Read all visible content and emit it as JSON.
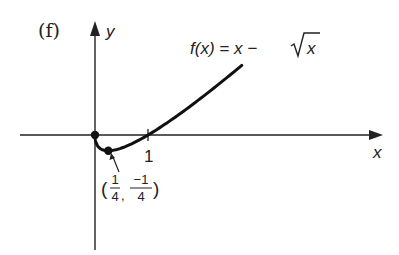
{
  "figure": {
    "panel_label": "(f)",
    "function_label": "f(x) = x − √x",
    "function_label_parts": {
      "lhs": "f(x) = x − ",
      "radicand": "x"
    }
  },
  "axes": {
    "x_label": "x",
    "y_label": "y",
    "x_tick_label": "1"
  },
  "annotation": {
    "point_label_open": "(",
    "point_x_num": "1",
    "point_x_den": "4",
    "point_sep": ",",
    "point_y_num": "−1",
    "point_y_den": "4",
    "point_label_close": ")"
  },
  "chart_data": {
    "type": "line",
    "title": "(f)",
    "xlabel": "x",
    "ylabel": "y",
    "series": [
      {
        "name": "f(x) = x − √x",
        "x": [
          0,
          0.0625,
          0.25,
          0.5,
          1,
          1.5,
          2,
          2.5,
          2.77
        ],
        "values": [
          0,
          -0.1875,
          -0.25,
          -0.207,
          0,
          0.275,
          0.586,
          0.919,
          1.106
        ]
      }
    ],
    "marked_points": [
      {
        "x": 0,
        "y": 0,
        "label": ""
      },
      {
        "x": 0.25,
        "y": -0.25,
        "label": "(1/4, −1/4)"
      }
    ],
    "x_ticks": [
      1
    ],
    "xlim": [
      -1.4,
      5.4
    ],
    "ylim": [
      -1.8,
      1.8
    ],
    "grid": false,
    "legend": "none"
  }
}
